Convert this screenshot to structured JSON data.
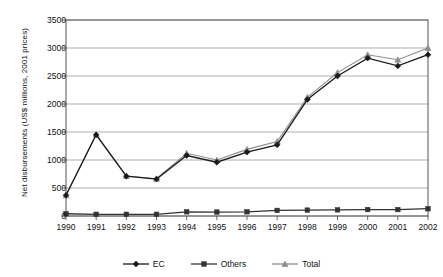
{
  "chart_data": {
    "type": "line",
    "title": "",
    "xlabel": "",
    "ylabel": "Net disbursements (US$ millions, 2001 prices)",
    "categories": [
      "1990",
      "1991",
      "1992",
      "1993",
      "1994",
      "1995",
      "1996",
      "1997",
      "1998",
      "1999",
      "2000",
      "2001",
      "2002"
    ],
    "x": [
      1990,
      1991,
      1992,
      1993,
      1994,
      1995,
      1996,
      1997,
      1998,
      1999,
      2000,
      2001,
      2002
    ],
    "ylim": [
      0,
      3500
    ],
    "yticks": [
      0,
      500,
      1000,
      1500,
      2000,
      2500,
      3000,
      3500
    ],
    "ytick_labels": [
      "0",
      "500",
      "1000",
      "1500",
      "2000",
      "2500",
      "3000",
      "3500"
    ],
    "grid": true,
    "legend_position": "bottom",
    "series": [
      {
        "name": "EC",
        "marker": "diamond",
        "color": "#1a1a1a",
        "values": [
          370,
          1450,
          710,
          660,
          1080,
          960,
          1140,
          1270,
          2080,
          2500,
          2820,
          2680,
          2880
        ]
      },
      {
        "name": "Others",
        "marker": "square",
        "color": "#333333",
        "values": [
          40,
          30,
          30,
          30,
          75,
          70,
          75,
          100,
          105,
          110,
          115,
          115,
          130
        ]
      },
      {
        "name": "Total",
        "marker": "triangle",
        "color": "#8c8c8c",
        "values": [
          370,
          1455,
          715,
          665,
          1120,
          1000,
          1190,
          1330,
          2120,
          2560,
          2880,
          2790,
          3000
        ]
      }
    ]
  },
  "legend": {
    "items": [
      {
        "label": "EC",
        "marker": "diamond-marker-icon"
      },
      {
        "label": "Others",
        "marker": "square-marker-icon"
      },
      {
        "label": "Total",
        "marker": "triangle-marker-icon"
      }
    ]
  },
  "axes": {
    "y_axis_title": "Net disbursements (US$ millions, 2001 prices)"
  },
  "colors": {
    "ec": "#1a1a1a",
    "others": "#333333",
    "total": "#8c8c8c",
    "grid": "#999999",
    "frame": "#555555",
    "background": "#ffffff"
  }
}
